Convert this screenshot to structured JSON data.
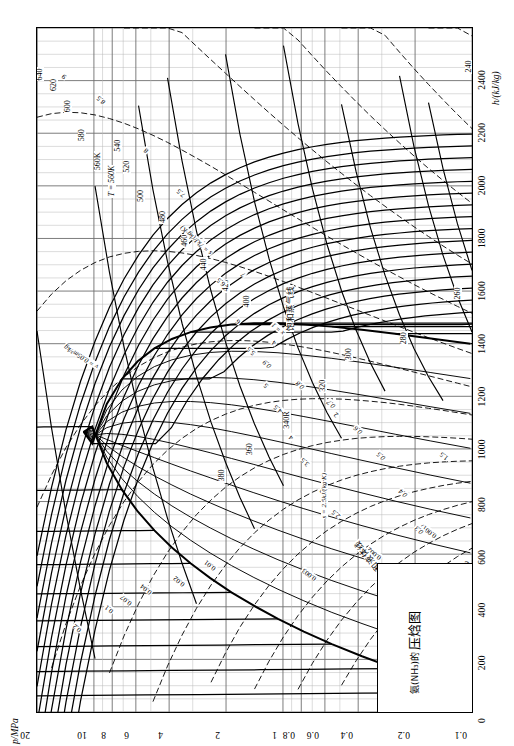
{
  "document": {
    "title_cn_main": "压焓图",
    "title_cn_sub": "氨(NH₃)的",
    "kind": "pressure-enthalpy diagram"
  },
  "axes": {
    "pressure": {
      "title": "p/MPa",
      "unit": "MPa",
      "scale": "log",
      "ticks": [
        "20",
        "10",
        "8",
        "6",
        "4",
        "2",
        "1",
        "0.8",
        "0.6",
        "0.4",
        "0.2",
        "0.1"
      ],
      "tick_values": [
        20,
        10,
        8,
        6,
        4,
        2,
        1,
        0.8,
        0.6,
        0.4,
        0.2,
        0.1
      ]
    },
    "enthalpy": {
      "title": "h/(kJ/kg)",
      "unit": "kJ/kg",
      "scale": "linear",
      "ticks": [
        "0",
        "200",
        "400",
        "600",
        "800",
        "1000",
        "1200",
        "1400",
        "1600",
        "1800",
        "2000",
        "2200",
        "2400"
      ],
      "tick_values": [
        0,
        200,
        400,
        600,
        800,
        1000,
        1200,
        1400,
        1600,
        1800,
        2000,
        2200,
        2400
      ]
    }
  },
  "chart_data": {
    "type": "line",
    "xlabel": "h/(kJ/kg)",
    "ylabel": "p/MPa",
    "xlim": [
      0,
      2600
    ],
    "ylim": [
      0.1,
      20
    ],
    "yscale": "log",
    "grid": true,
    "families": [
      {
        "name": "isotherms",
        "symbol": "T",
        "unit": "K",
        "lead_label": "T = 560K",
        "values": [
          240,
          260,
          280,
          300,
          320,
          340,
          360,
          380,
          400,
          420,
          440,
          460,
          480,
          500,
          520,
          540,
          560,
          580,
          600,
          620,
          640
        ],
        "labels": [
          "240",
          "260",
          "280",
          "300",
          "320",
          "340R",
          "360",
          "380",
          "400",
          "420",
          "440",
          "460",
          "480",
          "500",
          "520",
          "540",
          "560K",
          "580",
          "600",
          "620",
          "640"
        ]
      },
      {
        "name": "isochores",
        "symbol": "v",
        "unit": "m³/kg",
        "lead_label": "v = 0.001 m³/kg",
        "values": [
          0.001,
          0.0017,
          0.002,
          0.003,
          0.01,
          0.02,
          0.04,
          0.07,
          0.1,
          0.2,
          0.4,
          0.7,
          1.5,
          2,
          4,
          7
        ],
        "labels": [
          "0.001",
          "0.0017",
          "0.002",
          "0.003",
          "0.01",
          "0.02",
          "0.04",
          "0.07",
          "0.1",
          "0.2",
          "0.4",
          "0.7",
          "1.5",
          "2",
          "4",
          "7"
        ]
      },
      {
        "name": "isentropes",
        "symbol": "s",
        "unit": "kJ/(kg·K)",
        "lead_label": "s = 2.5kJ/(kg·K)",
        "lead_label_2": "s = 7kJ/(kg·K)",
        "values": [
          2.5,
          3,
          3.5,
          4,
          4.5,
          5,
          5.5,
          6,
          6.5,
          7,
          7.5,
          8,
          8.5,
          9
        ],
        "labels": [
          "2.5",
          "3",
          "3.5",
          "4",
          "4.5",
          "5",
          "5.5",
          "6",
          "6.5",
          "7",
          "7.5",
          "8",
          "8.5",
          "9"
        ]
      },
      {
        "name": "quality",
        "symbol": "x",
        "unit": "",
        "values": [
          0,
          0.1,
          0.2,
          0.3,
          0.4,
          0.5,
          0.6,
          0.7,
          0.8,
          0.9,
          1.0
        ],
        "labels": [
          "x = 0",
          "0.1",
          "0.2",
          "0.3",
          "0.4",
          "0.5",
          "0.6",
          "0.7",
          "0.8",
          "0.9",
          "x = 1"
        ]
      }
    ],
    "annotations": [
      {
        "id": "sat-liquid",
        "text": "饱和液体线"
      },
      {
        "id": "sat-vapor",
        "text": "饱和蒸气线"
      },
      {
        "id": "isotherm-lead",
        "text": "T = 560K"
      },
      {
        "id": "isochore-lead",
        "text": "v = 0.001 m³/kg"
      },
      {
        "id": "isochore-lead-2",
        "text": "v = 0.05m³/kg"
      },
      {
        "id": "isentrope-lead",
        "text": "s = 2.5kJ/(kg·K)"
      },
      {
        "id": "isentrope-lead-2",
        "text": "s = 7kJ/(kg·K)"
      }
    ]
  },
  "colors": {
    "ink": "#000000",
    "grid_minor": "#b9b9b9",
    "grid_major": "#6e6e6e",
    "paper": "#ffffff"
  }
}
